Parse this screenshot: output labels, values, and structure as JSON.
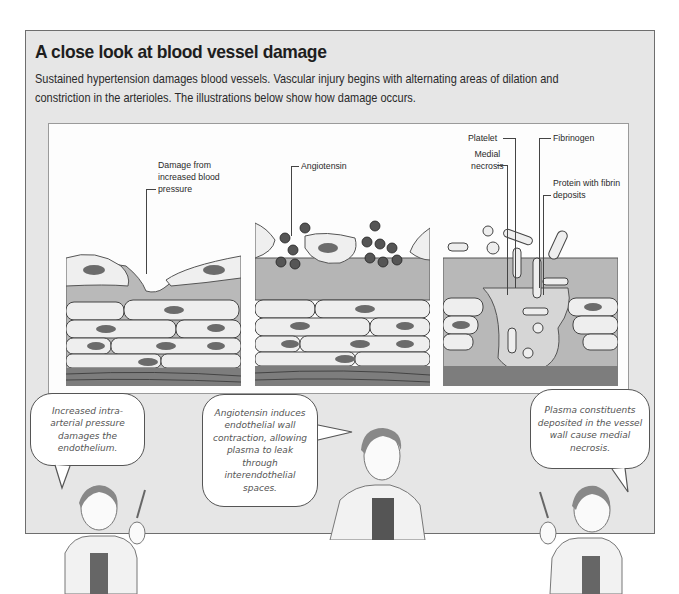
{
  "header": {
    "title": "A close look at blood vessel damage",
    "intro": "Sustained hypertension damages blood vessels. Vascular injury begins with alternating areas of dilation and constriction in the arterioles. The illustrations below show how damage occurs."
  },
  "illustrations": [
    {
      "id": "stage-1",
      "labels": [
        {
          "text": "Damage from increased blood pressure"
        }
      ]
    },
    {
      "id": "stage-2",
      "labels": [
        {
          "text": "Angiotensin"
        }
      ]
    },
    {
      "id": "stage-3",
      "labels": [
        {
          "text": "Platelet"
        },
        {
          "text": "Fibrinogen"
        },
        {
          "text": "Medial necrosis"
        },
        {
          "text": "Protein with fibrin deposits"
        }
      ]
    }
  ],
  "speech_bubbles": [
    {
      "text": "Increased intra-arterial pressure damages the endothelium."
    },
    {
      "text": "Angiotensin induces endothelial wall contraction, allowing plasma to leak through interendothelial spaces."
    },
    {
      "text": "Plasma constituents deposited in the vessel wall cause medial necrosis."
    }
  ],
  "colors": {
    "frame_bg": "#e6e6e6",
    "panel_bg": "#fdfdfd",
    "cell_fill": "#eeeeee",
    "nucleus": "#6b6b6b",
    "intima": "#b5b5b5",
    "media_dark": "#7a7a7a"
  }
}
